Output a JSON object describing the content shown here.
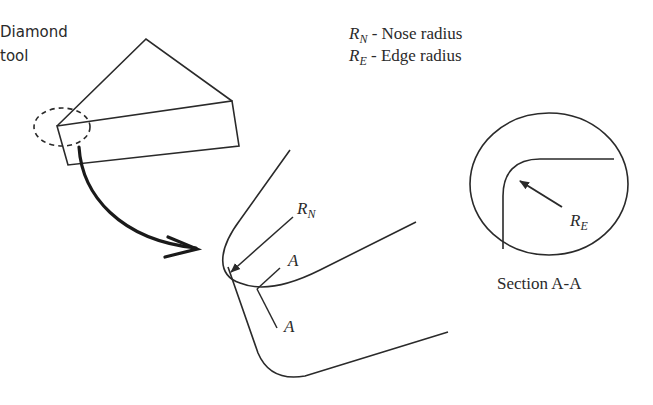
{
  "diagram": {
    "title_tool": [
      "Diamond",
      "tool"
    ],
    "legend": [
      {
        "symbol": "R",
        "subscript": "N",
        "text": " - Nose radius"
      },
      {
        "symbol": "R",
        "subscript": "E",
        "text": " - Edge radius"
      }
    ],
    "labels": {
      "nose_radius": {
        "symbol": "R",
        "subscript": "N"
      },
      "section_mark_top": "A",
      "section_mark_bottom": "A",
      "edge_radius": {
        "symbol": "R",
        "subscript": "E"
      },
      "section_caption": "Section A-A"
    },
    "colors": {
      "stroke": "#2a2a2a",
      "background": "#ffffff"
    }
  }
}
